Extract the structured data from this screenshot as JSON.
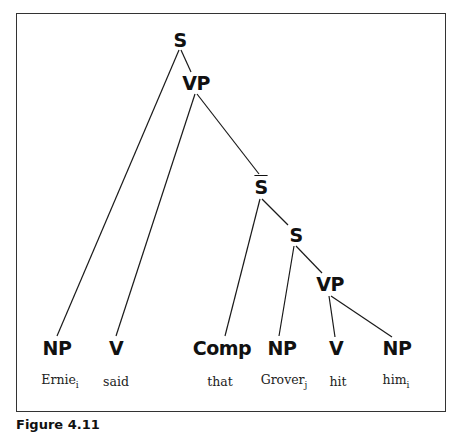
{
  "figure": {
    "caption": "Figure 4.11",
    "nodes": [
      {
        "id": "S_top",
        "label": "S",
        "x": 180,
        "y": 40
      },
      {
        "id": "VP_top",
        "label": "VP",
        "x": 196,
        "y": 83
      },
      {
        "id": "Sbar",
        "label": "S",
        "x": 261,
        "y": 187,
        "overline": true
      },
      {
        "id": "S_low",
        "label": "S",
        "x": 296,
        "y": 235
      },
      {
        "id": "VP_low",
        "label": "VP",
        "x": 330,
        "y": 284
      },
      {
        "id": "NP1",
        "label": "NP",
        "x": 57,
        "y": 348
      },
      {
        "id": "V1",
        "label": "V",
        "x": 116,
        "y": 348
      },
      {
        "id": "Comp",
        "label": "Comp",
        "x": 222,
        "y": 348
      },
      {
        "id": "NP2",
        "label": "NP",
        "x": 282,
        "y": 348
      },
      {
        "id": "V2",
        "label": "V",
        "x": 336,
        "y": 348
      },
      {
        "id": "NP3",
        "label": "NP",
        "x": 397,
        "y": 348
      }
    ],
    "edges": [
      {
        "from": [
          179,
          50
        ],
        "to": [
          57,
          336
        ]
      },
      {
        "from": [
          181,
          50
        ],
        "to": [
          191,
          72
        ]
      },
      {
        "from": [
          195,
          94
        ],
        "to": [
          116,
          336
        ]
      },
      {
        "from": [
          197,
          94
        ],
        "to": [
          259,
          174
        ]
      },
      {
        "from": [
          260,
          199
        ],
        "to": [
          225,
          336
        ]
      },
      {
        "from": [
          262,
          199
        ],
        "to": [
          288,
          225
        ]
      },
      {
        "from": [
          294,
          246
        ],
        "to": [
          279,
          336
        ]
      },
      {
        "from": [
          296,
          246
        ],
        "to": [
          322,
          273
        ]
      },
      {
        "from": [
          329,
          296
        ],
        "to": [
          335,
          337
        ]
      },
      {
        "from": [
          331,
          296
        ],
        "to": [
          392,
          337
        ]
      }
    ],
    "words": [
      {
        "text": "Ernie",
        "sub": "i",
        "x": 60,
        "y": 381
      },
      {
        "text": "said",
        "sub": "",
        "x": 116,
        "y": 381
      },
      {
        "text": "that",
        "sub": "",
        "x": 220,
        "y": 381
      },
      {
        "text": "Grover",
        "sub": "j",
        "x": 284,
        "y": 381
      },
      {
        "text": "hit",
        "sub": "",
        "x": 338,
        "y": 381
      },
      {
        "text": "him",
        "sub": "i",
        "x": 396,
        "y": 381
      }
    ],
    "colors": {
      "line": "#1a1a1a",
      "border": "#333333",
      "text": "#111111"
    }
  }
}
